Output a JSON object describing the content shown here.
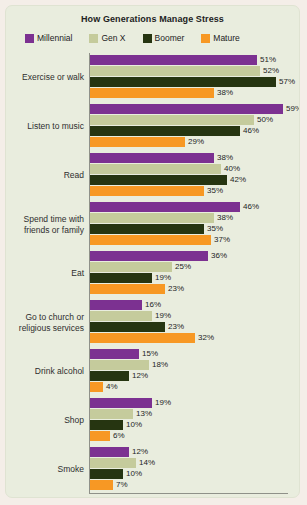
{
  "title": "How Generations Manage Stress",
  "colors": {
    "card_bg": "#e9edde",
    "axis": "#8f9189",
    "text": "#222222"
  },
  "legend": [
    {
      "label": "Millennial",
      "color": "#7c3191"
    },
    {
      "label": "Gen X",
      "color": "#c5cb9c"
    },
    {
      "label": "Boomer",
      "color": "#263511"
    },
    {
      "label": "Mature",
      "color": "#f79824"
    }
  ],
  "chart_data": {
    "type": "bar",
    "orientation": "horizontal",
    "title": "How Generations Manage Stress",
    "xlabel": "",
    "ylabel": "",
    "xlim": [
      0,
      63
    ],
    "grid": false,
    "legend_position": "top",
    "value_suffix": "%",
    "categories": [
      "Exercise or walk",
      "Listen to music",
      "Read",
      "Spend time with friends or family",
      "Eat",
      "Go to church or religious services",
      "Drink alcohol",
      "Shop",
      "Smoke"
    ],
    "series": [
      {
        "name": "Millennial",
        "color": "#7c3191",
        "values": [
          51,
          59,
          38,
          46,
          36,
          16,
          15,
          19,
          12
        ]
      },
      {
        "name": "Gen X",
        "color": "#c5cb9c",
        "values": [
          52,
          50,
          40,
          38,
          25,
          19,
          18,
          13,
          14
        ]
      },
      {
        "name": "Boomer",
        "color": "#263511",
        "values": [
          57,
          46,
          42,
          35,
          19,
          23,
          12,
          10,
          10
        ]
      },
      {
        "name": "Mature",
        "color": "#f79824",
        "values": [
          38,
          29,
          35,
          37,
          23,
          32,
          4,
          6,
          7
        ]
      }
    ]
  }
}
